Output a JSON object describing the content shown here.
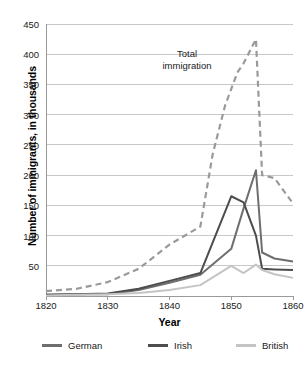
{
  "chart_data": {
    "type": "line",
    "title": "",
    "xlabel": "Year",
    "ylabel": "Number of immigrants, in thousands",
    "xlim": [
      1820,
      1860
    ],
    "ylim": [
      0,
      450
    ],
    "grid": true,
    "legend_position": "bottom",
    "y_ticks": [
      50,
      100,
      150,
      200,
      250,
      300,
      350,
      400,
      450
    ],
    "x_ticks": [
      1820,
      1830,
      1840,
      1850,
      1860
    ],
    "annotations": [
      {
        "text": "Total immigration",
        "line1": "Total",
        "line2": "immigration",
        "x": 1848,
        "y": 385
      }
    ],
    "series": [
      {
        "name": "Total immigration",
        "style": "dashed",
        "color": "#9a9a9a",
        "x": [
          1820,
          1825,
          1830,
          1835,
          1840,
          1845,
          1847,
          1849,
          1851,
          1852,
          1854,
          1855,
          1857,
          1860
        ],
        "values": [
          8,
          12,
          23,
          45,
          85,
          115,
          235,
          315,
          370,
          385,
          425,
          200,
          195,
          153
        ]
      },
      {
        "name": "German",
        "style": "solid",
        "color": "#6e6e6e",
        "x": [
          1820,
          1825,
          1830,
          1835,
          1840,
          1845,
          1850,
          1852,
          1854,
          1855,
          1857,
          1860
        ],
        "values": [
          2,
          3,
          3,
          10,
          22,
          35,
          78,
          145,
          208,
          72,
          62,
          57
        ]
      },
      {
        "name": "Irish",
        "style": "solid",
        "color": "#4d4d4d",
        "x": [
          1820,
          1825,
          1830,
          1835,
          1840,
          1845,
          1850,
          1852,
          1854,
          1855,
          1857,
          1860
        ],
        "values": [
          2,
          3,
          4,
          12,
          25,
          38,
          165,
          155,
          100,
          45,
          44,
          43
        ]
      },
      {
        "name": "British",
        "style": "solid",
        "color": "#c4c4c4",
        "x": [
          1820,
          1825,
          1830,
          1835,
          1840,
          1845,
          1850,
          1852,
          1854,
          1855,
          1857,
          1860
        ],
        "values": [
          1,
          2,
          3,
          5,
          10,
          18,
          50,
          38,
          52,
          43,
          36,
          30
        ]
      }
    ],
    "legend": [
      {
        "label": "German",
        "color": "#6e6e6e"
      },
      {
        "label": "Irish",
        "color": "#4d4d4d"
      },
      {
        "label": "British",
        "color": "#c4c4c4"
      }
    ],
    "colors": {
      "grid": "#c8c8c8",
      "axis": "#9a9a9a",
      "text": "#1a1a1a",
      "background": "#ffffff"
    }
  }
}
